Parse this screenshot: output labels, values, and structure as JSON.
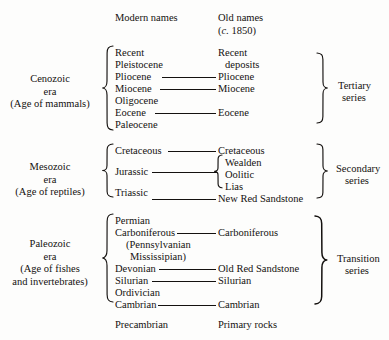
{
  "diagram": {
    "background_color": "#fdfdfc",
    "ink_color": "#14110f"
  },
  "headers": {
    "modern": "Modern names",
    "old_line1": "Old names",
    "old_italic": "c.",
    "old_year": "1850"
  },
  "eras": [
    {
      "id": "cenozoic",
      "name": "Cenozoic",
      "word_era": "era",
      "subtitle": "(Age of mammals)",
      "series_line1": "Tertiary",
      "series_line2": "series",
      "modern": [
        "Recent",
        "Pleistocene",
        "Pliocene",
        "Miocene",
        "Oligocene",
        "Eocene",
        "Paleocene"
      ],
      "old": [
        "Recent",
        "deposits",
        "Pliocene",
        "Miocene",
        "Eocene"
      ]
    },
    {
      "id": "mesozoic",
      "name": "Mesozoic",
      "word_era": "era",
      "subtitle": "(Age of reptiles)",
      "series_line1": "Secondary",
      "series_line2": "series",
      "modern": [
        "Cretaceous",
        "Jurassic",
        "Triassic"
      ],
      "old": [
        "Cretaceous",
        "Wealden",
        "Oolitic",
        "Lias",
        "New Red Sandstone"
      ]
    },
    {
      "id": "paleozoic",
      "name": "Paleozoic",
      "word_era": "era",
      "subtitle_line1": "(Age of fishes",
      "subtitle_line2": "and invertebrates)",
      "series_line1": "Transition",
      "series_line2": "series",
      "modern": [
        "Permian",
        "Carboniferous",
        "(Pennsylvanian",
        "Mississipian)",
        "Devonian",
        "Silurian",
        "Ordivician",
        "Cambrian"
      ],
      "old": [
        "Carboniferous",
        "Old Red Sandstone",
        "Silurian",
        "Cambrian"
      ]
    }
  ],
  "footer": {
    "modern": "Precambrian",
    "old": "Primary rocks"
  }
}
